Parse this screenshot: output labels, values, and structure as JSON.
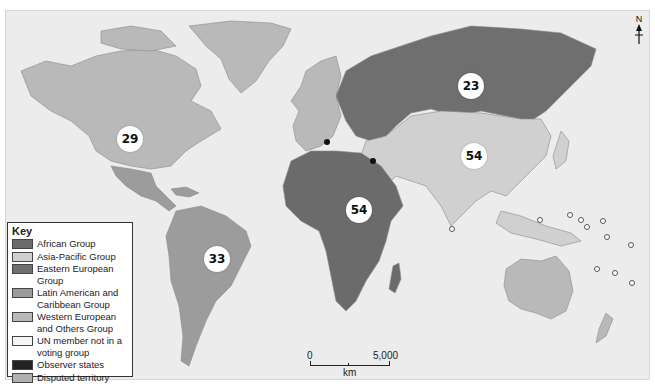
{
  "map": {
    "title": "UN regional voting groups",
    "ocean_color": "#ececec",
    "colors": {
      "african": "#6b6b6b",
      "asia_pacific": "#d0d0d0",
      "eastern_european": "#6f6f6f",
      "latin_american": "#9c9c9c",
      "western_european": "#b9b9b9",
      "not_in_group": "#f5f5f5",
      "observer": "#222222",
      "disputed": "#b0b0b0"
    },
    "group_counts": [
      {
        "group": "Western European and Others Group",
        "label": "29",
        "x": 129,
        "y": 138
      },
      {
        "group": "Eastern European Group",
        "label": "23",
        "x": 470,
        "y": 85
      },
      {
        "group": "Asia-Pacific Group",
        "label": "54",
        "x": 473,
        "y": 155
      },
      {
        "group": "African Group",
        "label": "54",
        "x": 358,
        "y": 209
      },
      {
        "group": "Latin American and Caribbean Group",
        "label": "33",
        "x": 216,
        "y": 258
      }
    ],
    "observer_states": [
      {
        "name": "Vatican",
        "x": 326,
        "y": 141
      },
      {
        "name": "Palestine",
        "x": 372,
        "y": 160
      }
    ]
  },
  "legend": {
    "title": "Key",
    "items": [
      {
        "label": "African Group",
        "color": "#6b6b6b"
      },
      {
        "label": "Asia-Pacific Group",
        "color": "#d0d0d0"
      },
      {
        "label": "Eastern European Group",
        "color": "#6f6f6f"
      },
      {
        "label": "Latin American and Caribbean Group",
        "color": "#9c9c9c"
      },
      {
        "label": "Western European and Others Group",
        "color": "#b9b9b9"
      },
      {
        "label": "UN member not in a voting group",
        "color": "#f5f5f5"
      },
      {
        "label": "Observer states",
        "color": "#222222"
      },
      {
        "label": "Disputed territory",
        "color": "#b0b0b0"
      }
    ]
  },
  "compass": {
    "label": "N"
  },
  "scale_bar": {
    "start": "0",
    "end": "5,000",
    "unit": "km"
  }
}
